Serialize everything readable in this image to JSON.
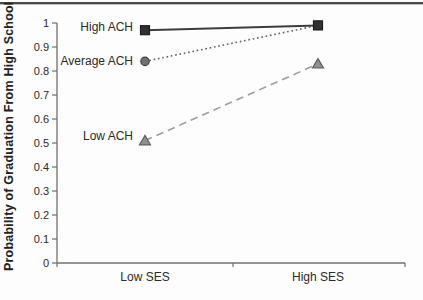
{
  "figure": {
    "background": "#fdfdfd",
    "top_rule_color": "#4a4a4a"
  },
  "chart_data": {
    "type": "line",
    "title": "",
    "xlabel": "",
    "ylabel": "Probability of Graduation From High School",
    "categories": [
      "Low SES",
      "High SES"
    ],
    "ylim": [
      0,
      1
    ],
    "y_ticks": [
      1,
      0.9,
      0.8,
      0.7,
      0.6,
      0.5,
      0.4,
      0.3,
      0.2,
      0.1,
      0
    ],
    "y_tick_labels": [
      "1",
      "0.9",
      "0.8",
      "0.7",
      "0.6",
      "0.5",
      "0.4",
      "0.3",
      "0.2",
      "0.1",
      "0"
    ],
    "grid": false,
    "legend_position": "inline-labels-left-of-first-point",
    "axis_color": "#6f6f6f",
    "text_color": "#2b2b2b",
    "series": [
      {
        "name": "High ACH",
        "values": [
          0.97,
          0.99
        ],
        "marker": "square",
        "line_style": "solid",
        "line_color": "#3d3d3d",
        "marker_fill": "#303030",
        "marker_stroke": "#1c1c1c"
      },
      {
        "name": "Average ACH",
        "values": [
          0.84,
          0.99
        ],
        "marker": "circle",
        "line_style": "dotted",
        "line_color": "#5f5f5f",
        "marker_fill": "#707070",
        "marker_stroke": "#3f3f3f"
      },
      {
        "name": "Low ACH",
        "values": [
          0.51,
          0.83
        ],
        "marker": "triangle",
        "line_style": "dashed",
        "line_color": "#9e9e9e",
        "marker_fill": "#909090",
        "marker_stroke": "#5e5e5e"
      }
    ]
  }
}
